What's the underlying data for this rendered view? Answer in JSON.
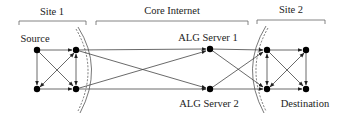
{
  "regions": {
    "site1": {
      "label": "Site 1"
    },
    "core": {
      "label": "Core Internet"
    },
    "site2": {
      "label": "Site 2"
    }
  },
  "nodes": {
    "source": {
      "label": "Source"
    },
    "alg1": {
      "label": "ALG Server 1"
    },
    "alg2": {
      "label": "ALG Server 2"
    },
    "destination": {
      "label": "Destination"
    }
  },
  "colors": {
    "stroke": "#444444",
    "node": "#000000",
    "text": "#222222"
  }
}
